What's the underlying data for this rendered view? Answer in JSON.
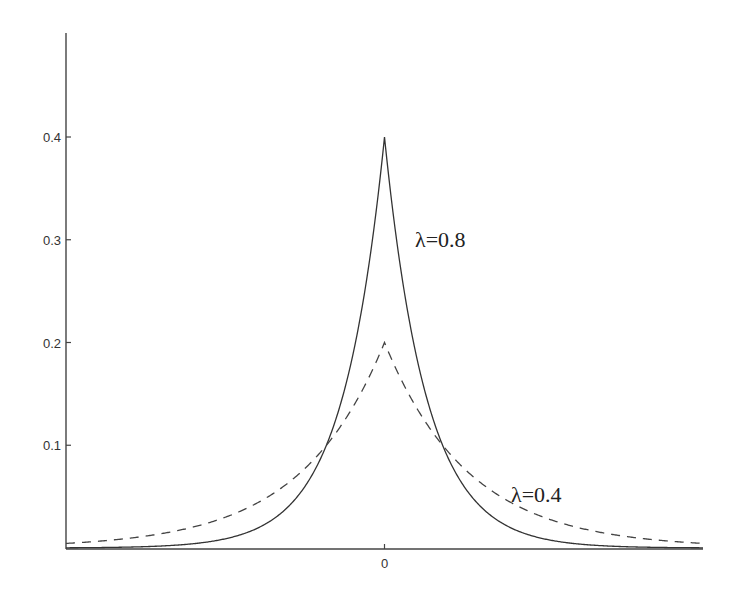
{
  "chart_data": {
    "type": "line",
    "title": "",
    "xlabel": "",
    "ylabel": "",
    "xlim": [
      -9.5,
      9.5
    ],
    "ylim": [
      0,
      0.48
    ],
    "x_ticks": [
      {
        "value": 0,
        "label": "0"
      }
    ],
    "y_ticks": [
      {
        "value": 0.1,
        "label": "0.1"
      },
      {
        "value": 0.2,
        "label": "0.2"
      },
      {
        "value": 0.3,
        "label": "0.3"
      },
      {
        "value": 0.4,
        "label": "0.4"
      }
    ],
    "grid": false,
    "legend": null,
    "series": [
      {
        "name": "λ=0.8",
        "style": "solid",
        "formula": "(λ/2)·exp(-λ|x|)",
        "lambda": 0.8,
        "peak": 0.4,
        "x": [
          -9.5,
          -8,
          -6,
          -4,
          -3,
          -2,
          -1.733,
          -1,
          -0.5,
          0,
          0.5,
          1,
          1.733,
          2,
          3,
          4,
          6,
          8,
          9.5
        ],
        "values": [
          0.0002,
          0.0007,
          0.0033,
          0.0163,
          0.0363,
          0.0808,
          0.1,
          0.1797,
          0.2681,
          0.4,
          0.2681,
          0.1797,
          0.1,
          0.0808,
          0.0363,
          0.0163,
          0.0033,
          0.0007,
          0.0002
        ]
      },
      {
        "name": "λ=0.4",
        "style": "dashed",
        "formula": "(λ/2)·exp(-λ|x|)",
        "lambda": 0.4,
        "peak": 0.2,
        "x": [
          -9.5,
          -8,
          -6,
          -4,
          -3,
          -2,
          -1.733,
          -1,
          -0.5,
          0,
          0.5,
          1,
          1.733,
          2,
          3,
          4,
          6,
          8,
          9.5
        ],
        "values": [
          0.0045,
          0.0082,
          0.0181,
          0.0404,
          0.0602,
          0.0899,
          0.1,
          0.1341,
          0.1637,
          0.2,
          0.1637,
          0.1341,
          0.1,
          0.0899,
          0.0602,
          0.0404,
          0.0181,
          0.0082,
          0.0045
        ]
      }
    ],
    "annotations": [
      {
        "text": "λ=0.8",
        "series": "λ=0.8"
      },
      {
        "text": "λ=0.4",
        "series": "λ=0.4"
      }
    ]
  },
  "plot": {
    "x_left_px": 66,
    "x_right_px": 703,
    "y_zero_px": 548,
    "y_top_px": 33,
    "px_per_y_unit": 1027.5
  }
}
